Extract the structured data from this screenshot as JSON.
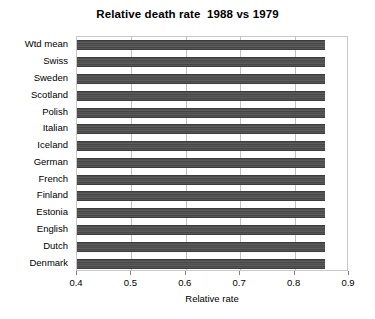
{
  "chart_data": {
    "type": "bar",
    "orientation": "horizontal",
    "title": "Relative death rate  1988 vs 1979",
    "xlabel": "Relative rate",
    "ylabel": "",
    "xlim": [
      0.4,
      0.9
    ],
    "xticks": [
      "0.4",
      "0.5",
      "0.6",
      "0.7",
      "0.8",
      "0.9"
    ],
    "grid": true,
    "grid_axis": "x",
    "legend": null,
    "bar_color": "#4e4e4e",
    "categories": [
      "Wtd mean",
      "Swiss",
      "Sweden",
      "Scotland",
      "Polish",
      "Italian",
      "Iceland",
      "German",
      "French",
      "Finland",
      "Estonia",
      "English",
      "Dutch",
      "Denmark"
    ],
    "values": [
      0.855,
      0.855,
      0.856,
      0.856,
      0.855,
      0.856,
      0.855,
      0.856,
      0.855,
      0.856,
      0.855,
      0.856,
      0.855,
      0.856
    ]
  }
}
